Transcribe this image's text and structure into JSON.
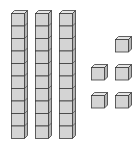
{
  "diagram": {
    "tens_rods": [
      {
        "id": "rod-1",
        "units": 10,
        "x": 11,
        "y": 10
      },
      {
        "id": "rod-2",
        "units": 10,
        "x": 35,
        "y": 10
      },
      {
        "id": "rod-3",
        "units": 10,
        "x": 59,
        "y": 10
      }
    ],
    "unit_cubes": [
      {
        "id": "unit-1",
        "x": 115,
        "y": 36
      },
      {
        "id": "unit-2",
        "x": 91,
        "y": 64
      },
      {
        "id": "unit-3",
        "x": 115,
        "y": 64
      },
      {
        "id": "unit-4",
        "x": 91,
        "y": 92
      },
      {
        "id": "unit-5",
        "x": 115,
        "y": 92
      }
    ],
    "represented_value": 35,
    "colors": {
      "face": "#d4d4d4",
      "top": "#e6e6e6",
      "side": "#b4b4b4",
      "edge": "#3a3a3a"
    }
  }
}
